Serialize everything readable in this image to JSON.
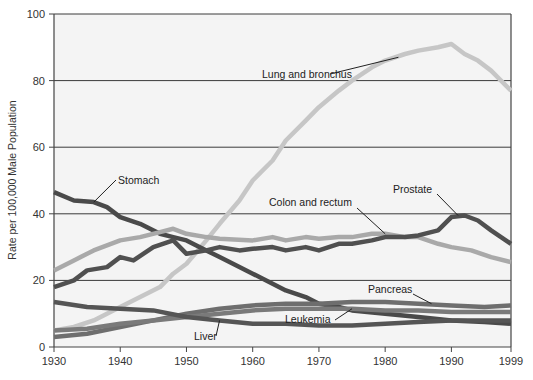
{
  "chart_data": {
    "type": "line",
    "title": "",
    "xlabel": "",
    "ylabel": "Rate per 100,000 Male Population",
    "xlim": [
      1930,
      1999
    ],
    "ylim": [
      0,
      100
    ],
    "x_ticks": [
      1930,
      1940,
      1950,
      1960,
      1970,
      1980,
      1990,
      1999
    ],
    "y_ticks": [
      0,
      20,
      40,
      60,
      80,
      100
    ],
    "grid": "horizontal",
    "legend": "inline-labels",
    "series": [
      {
        "name": "Lung and bronchus",
        "color": "#c6c6c6",
        "x": [
          1930,
          1933,
          1936,
          1940,
          1943,
          1946,
          1948,
          1950,
          1953,
          1955,
          1958,
          1960,
          1963,
          1965,
          1968,
          1970,
          1973,
          1975,
          1978,
          1980,
          1983,
          1985,
          1988,
          1990,
          1992,
          1994,
          1996,
          1999
        ],
        "values": [
          5,
          6,
          8,
          12,
          15,
          18,
          22,
          25,
          32,
          37,
          44,
          50,
          56,
          62,
          68,
          72,
          77,
          80,
          84,
          86,
          88,
          89,
          90,
          91,
          88,
          86,
          83,
          77
        ]
      },
      {
        "name": "Stomach",
        "color": "#4a4a4a",
        "x": [
          1930,
          1933,
          1936,
          1938,
          1940,
          1943,
          1946,
          1948,
          1950,
          1953,
          1955,
          1958,
          1960,
          1963,
          1965,
          1968,
          1970,
          1973,
          1975,
          1980,
          1985,
          1990,
          1995,
          1999
        ],
        "values": [
          46.5,
          44,
          43.5,
          42,
          39,
          37,
          34,
          33,
          32,
          29,
          27,
          24,
          22,
          19,
          17,
          15,
          13,
          12,
          11,
          10,
          9,
          8,
          7.5,
          7
        ]
      },
      {
        "name": "Colon and rectum",
        "color": "#a9a9a9",
        "x": [
          1930,
          1933,
          1936,
          1940,
          1943,
          1946,
          1948,
          1950,
          1953,
          1955,
          1960,
          1963,
          1965,
          1968,
          1970,
          1973,
          1975,
          1978,
          1980,
          1983,
          1985,
          1988,
          1990,
          1993,
          1996,
          1999
        ],
        "values": [
          23,
          26,
          29,
          32,
          33,
          34.5,
          35.5,
          34,
          33,
          32.5,
          32,
          33,
          32,
          33,
          32.5,
          33,
          33,
          34,
          34,
          33,
          33,
          31,
          30,
          29,
          27,
          25.5
        ]
      },
      {
        "name": "Prostate",
        "color": "#505050",
        "x": [
          1930,
          1933,
          1935,
          1938,
          1940,
          1942,
          1945,
          1948,
          1950,
          1953,
          1955,
          1958,
          1960,
          1963,
          1965,
          1968,
          1970,
          1973,
          1975,
          1978,
          1980,
          1983,
          1985,
          1988,
          1990,
          1992,
          1994,
          1996,
          1999
        ],
        "values": [
          18,
          20,
          23,
          24,
          27,
          26,
          30,
          32,
          28,
          29,
          30,
          29,
          29.5,
          30,
          29,
          30,
          29,
          31,
          31,
          32,
          33,
          33,
          33.5,
          35,
          39,
          39.5,
          38,
          35,
          31
        ]
      },
      {
        "name": "Pancreas",
        "color": "#6e6e6e",
        "x": [
          1930,
          1935,
          1940,
          1945,
          1950,
          1955,
          1960,
          1965,
          1970,
          1975,
          1980,
          1985,
          1990,
          1995,
          1999
        ],
        "values": [
          3,
          4,
          6,
          8,
          10,
          11.5,
          12.5,
          13,
          13,
          13.5,
          13.5,
          13,
          12.5,
          12,
          12.5
        ]
      },
      {
        "name": "Leukemia",
        "color": "#7a7a7a",
        "x": [
          1930,
          1935,
          1940,
          1945,
          1950,
          1955,
          1960,
          1965,
          1970,
          1975,
          1980,
          1985,
          1990,
          1995,
          1999
        ],
        "values": [
          5,
          5.5,
          7,
          8,
          9,
          10,
          11,
          11.5,
          11.5,
          11.5,
          11,
          11,
          10.5,
          10.5,
          10.5
        ]
      },
      {
        "name": "Liver",
        "color": "#555555",
        "x": [
          1930,
          1935,
          1940,
          1945,
          1950,
          1955,
          1960,
          1965,
          1970,
          1975,
          1980,
          1985,
          1990,
          1995,
          1999
        ],
        "values": [
          13.5,
          12,
          11.5,
          11,
          9,
          8,
          7,
          7,
          6.5,
          6.5,
          7,
          7.5,
          8,
          8,
          8
        ]
      }
    ],
    "annotations": [
      {
        "text": "Lung and bronchus",
        "series": "Lung and bronchus",
        "point": [
          1982,
          87
        ]
      },
      {
        "text": "Stomach",
        "series": "Stomach",
        "point": [
          1936,
          43.5
        ]
      },
      {
        "text": "Colon and rectum",
        "series": "Colon and rectum",
        "point": [
          1980,
          34
        ]
      },
      {
        "text": "Prostate",
        "series": "Prostate",
        "point": [
          1991,
          39.5
        ]
      },
      {
        "text": "Pancreas",
        "series": "Pancreas",
        "point": [
          1987,
          13
        ]
      },
      {
        "text": "Leukemia",
        "series": "Leukemia",
        "point": [
          1975,
          11.5
        ]
      },
      {
        "text": "Liver",
        "series": "Liver",
        "point": [
          1955,
          8
        ]
      }
    ]
  }
}
